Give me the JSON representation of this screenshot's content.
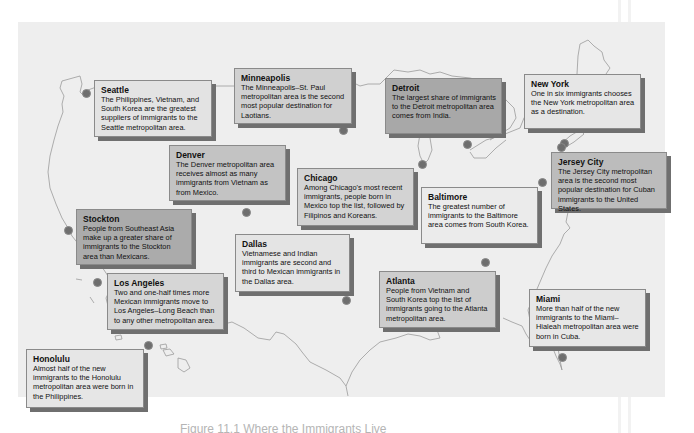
{
  "figure": {
    "caption": "Figure 11.1 Where the Immigrants Live"
  },
  "colors": {
    "panel_bg": "#eeeeee",
    "dot": "#6e6e6e",
    "outline": "#9a9a9a",
    "shadow": "#6f6f6f"
  },
  "callouts": [
    {
      "id": "seattle",
      "city": "Seattle",
      "text": "The Philippines, Vietnam, and South Korea are the greatest suppliers of immigrants to the Seattle metropolitan area.",
      "shade": "#e3e3e3"
    },
    {
      "id": "minneapolis",
      "city": "Minneapolis",
      "text": "The Minneapolis–St. Paul metropolitan area is the second most popular destination for Laotians.",
      "shade": "#d0d0d0"
    },
    {
      "id": "detroit",
      "city": "Detroit",
      "text": "The largest share of immigrants to the Detroit metropolitan area comes from India.",
      "shade": "#a8a8a8"
    },
    {
      "id": "new_york",
      "city": "New York",
      "text": "One in six immigrants chooses the New York metropolitan area as a destination.",
      "shade": "#e6e6e6"
    },
    {
      "id": "jersey_city",
      "city": "Jersey City",
      "text": "The Jersey City metropolitan area is the second most popular destination for Cuban immigrants to the United States.",
      "shade": "#bcbcbc"
    },
    {
      "id": "denver",
      "city": "Denver",
      "text": "The Denver metropolitan area receives almost as many immigrants from Vietnam as from Mexico.",
      "shade": "#c3c3c3"
    },
    {
      "id": "chicago",
      "city": "Chicago",
      "text": "Among Chicago's most recent immigrants, people born in Mexico top the list, followed by Filipinos and Koreans.",
      "shade": "#d3d3d3"
    },
    {
      "id": "baltimore",
      "city": "Baltimore",
      "text": "The greatest number of immigrants to the Baltimore area comes from South Korea.",
      "shade": "#ebebeb"
    },
    {
      "id": "stockton",
      "city": "Stockton",
      "text": "People from Southeast Asia make up a greater share of immigrants to the Stockton area than Mexicans.",
      "shade": "#ababab"
    },
    {
      "id": "dallas",
      "city": "Dallas",
      "text": "Vietnamese and Indian immigrants are second and third to Mexican immigrants in the Dallas area.",
      "shade": "#e4e4e4"
    },
    {
      "id": "los_angeles",
      "city": "Los Angeles",
      "text": "Two and one-half times more Mexican immigrants move to Los Angeles–Long Beach than to any other metropolitan area.",
      "shade": "#d6d6d6"
    },
    {
      "id": "atlanta",
      "city": "Atlanta",
      "text": "People from Vietnam and South Korea top the list of immigrants going to the Atlanta metropolitan area.",
      "shade": "#cdcdcd"
    },
    {
      "id": "miami",
      "city": "Miami",
      "text": "More than half of the new immigrants to the Miami–Hialeah metropolitan area were born in Cuba.",
      "shade": "#e7e7e7"
    },
    {
      "id": "honolulu",
      "city": "Honolulu",
      "text": "Almost half of the new immigrants to the Honolulu metropolitan area were born in the Philippines.",
      "shade": "#e6e6e6"
    }
  ]
}
